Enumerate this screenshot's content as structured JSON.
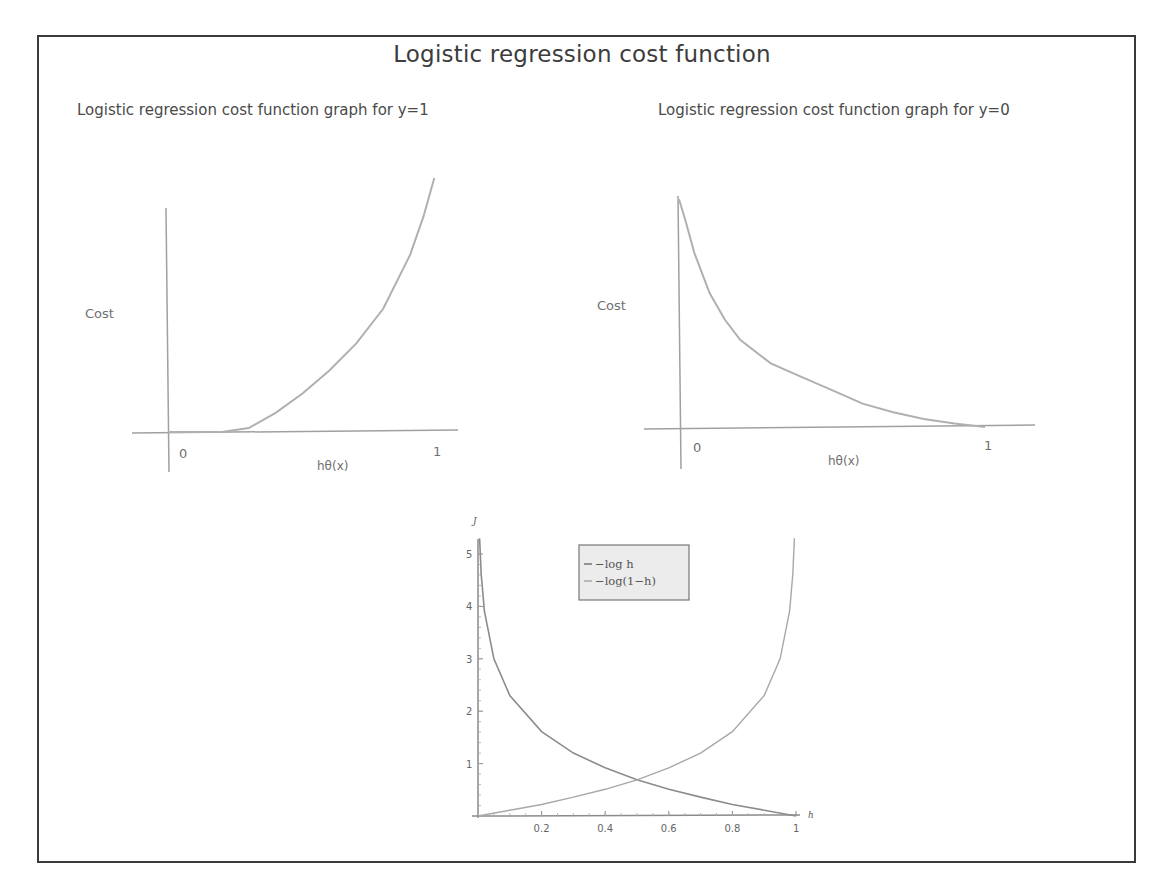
{
  "title": "Logistic regression cost function",
  "chart_data": [
    {
      "type": "line",
      "title": "Logistic regression cost function graph for y=1",
      "xlabel": "hθ(x)",
      "ylabel": "Cost",
      "x_ticks": [
        "0",
        "1"
      ],
      "grid": false,
      "legend": null,
      "series": [
        {
          "name": "cost (y=1, sketch)",
          "x": [
            0,
            0.1,
            0.2,
            0.3,
            0.4,
            0.5,
            0.6,
            0.7,
            0.8,
            0.9,
            0.95,
            0.99
          ],
          "y": [
            0,
            0,
            0,
            0.05,
            0.25,
            0.5,
            0.8,
            1.15,
            1.6,
            2.3,
            2.8,
            3.3
          ]
        }
      ]
    },
    {
      "type": "line",
      "title": "Logistic regression cost function graph for y=0",
      "xlabel": "hθ(x)",
      "ylabel": "Cost",
      "x_ticks": [
        "0",
        "1"
      ],
      "grid": false,
      "legend": null,
      "series": [
        {
          "name": "cost (y=0, sketch)",
          "x": [
            0,
            0.02,
            0.05,
            0.1,
            0.15,
            0.2,
            0.3,
            0.4,
            0.5,
            0.6,
            0.7,
            0.8,
            0.9,
            1.0
          ],
          "y": [
            3.4,
            3.1,
            2.6,
            2.0,
            1.6,
            1.3,
            0.95,
            0.75,
            0.55,
            0.35,
            0.22,
            0.12,
            0.05,
            0
          ]
        }
      ]
    },
    {
      "type": "line",
      "title": "",
      "xlabel": "h",
      "ylabel": "J",
      "xlim": [
        0,
        1
      ],
      "ylim": [
        0,
        5.2
      ],
      "x_ticks": [
        "0.2",
        "0.4",
        "0.6",
        "0.8",
        "1"
      ],
      "y_ticks": [
        "1",
        "2",
        "3",
        "4",
        "5"
      ],
      "grid": false,
      "legend_position": "upper center",
      "series": [
        {
          "name": "−log h",
          "x": [
            0.005,
            0.01,
            0.02,
            0.05,
            0.1,
            0.2,
            0.3,
            0.4,
            0.5,
            0.6,
            0.7,
            0.8,
            0.9,
            1.0
          ],
          "y": [
            5.3,
            4.61,
            3.91,
            3.0,
            2.3,
            1.61,
            1.2,
            0.92,
            0.69,
            0.51,
            0.36,
            0.22,
            0.11,
            0
          ]
        },
        {
          "name": "−log(1−h)",
          "x": [
            0,
            0.1,
            0.2,
            0.3,
            0.4,
            0.5,
            0.6,
            0.7,
            0.8,
            0.9,
            0.95,
            0.98,
            0.99,
            0.995
          ],
          "y": [
            0,
            0.11,
            0.22,
            0.36,
            0.51,
            0.69,
            0.92,
            1.2,
            1.61,
            2.3,
            3.0,
            3.91,
            4.61,
            5.3
          ]
        }
      ]
    }
  ],
  "labels": {
    "left_ylabel": "Cost",
    "left_xlabel": "hθ(x)",
    "left_x0": "0",
    "left_x1": "1",
    "right_ylabel": "Cost",
    "right_xlabel": "hθ(x)",
    "right_x0": "0",
    "right_x1": "1",
    "bottom_ylabel": "J",
    "bottom_xlabel": "h",
    "legend_1": "−log h",
    "legend_2": "−log(1−h)"
  },
  "colors": {
    "frame": "#3a3a3a",
    "axis": "#9a9a9a",
    "curve_sketch": "#b5b5b5",
    "curve_bottom": "#8a8a8a",
    "legend_bg": "#ececec"
  }
}
